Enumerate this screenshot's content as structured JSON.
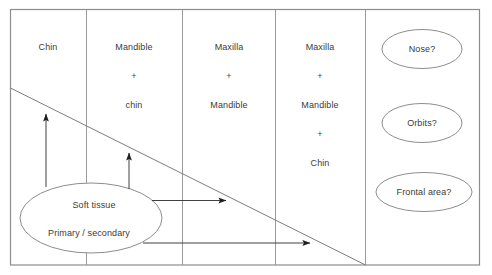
{
  "diagram": {
    "frame": {
      "color": "#8a8a8a"
    },
    "columns": [
      {
        "name": "column-chin",
        "lines": [
          "Chin"
        ]
      },
      {
        "name": "column-mandible-chin",
        "lines": [
          "Mandible",
          "+",
          "chin"
        ]
      },
      {
        "name": "column-maxilla-mandible",
        "lines": [
          "Maxilla",
          "+",
          "Mandible"
        ]
      },
      {
        "name": "column-maxilla-mandible-chin",
        "lines": [
          "Maxilla",
          "+",
          "Mandible",
          "+",
          "Chin"
        ]
      }
    ],
    "question_nodes": [
      {
        "name": "node-nose",
        "label": "Nose?"
      },
      {
        "name": "node-orbits",
        "label": "Orbits?"
      },
      {
        "name": "node-frontal-area",
        "label": "Frontal area?"
      }
    ],
    "source_node": {
      "name": "node-soft-tissue",
      "line1": "Soft tissue",
      "line2": "Primary / secondary"
    },
    "arrows": [
      {
        "name": "arrow-up-chin",
        "direction": "up"
      },
      {
        "name": "arrow-up-mandible",
        "direction": "up"
      },
      {
        "name": "arrow-right-short",
        "direction": "right"
      },
      {
        "name": "arrow-right-long",
        "direction": "right"
      }
    ],
    "diagonal": {
      "name": "diagonal-gradient-line"
    }
  }
}
